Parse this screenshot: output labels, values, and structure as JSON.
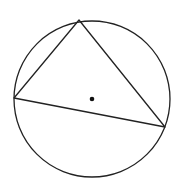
{
  "diagram": {
    "shapes": [
      {
        "type": "circle",
        "name": "circumcircle"
      },
      {
        "type": "triangle",
        "name": "inscribed-triangle",
        "vertices": [
          "top",
          "left",
          "right"
        ]
      },
      {
        "type": "point",
        "name": "center"
      }
    ],
    "colors": {
      "stroke": "#222222",
      "background": "#ffffff"
    }
  }
}
